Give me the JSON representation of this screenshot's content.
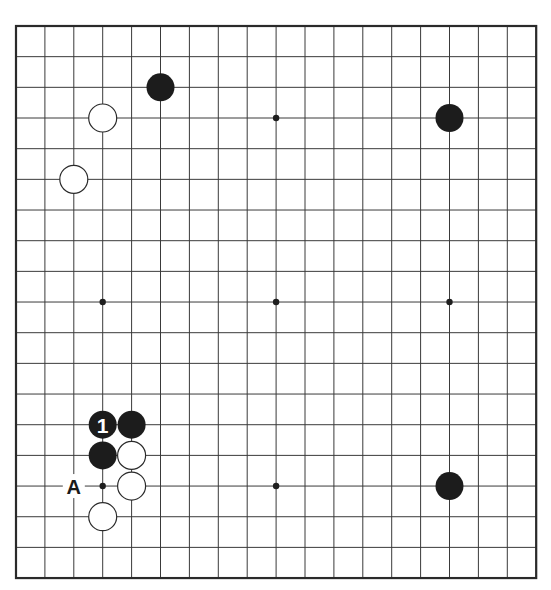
{
  "board": {
    "size": 19,
    "origin_x": 16,
    "origin_y": 26,
    "spacing_x": 28.9,
    "spacing_y": 30.67,
    "stone_radius": 14,
    "colors": {
      "line": "#3a3a3a",
      "black_stone": "#1c1c1c",
      "white_stone": "#ffffff",
      "background": "#ffffff"
    }
  },
  "hoshi": [
    {
      "col": 3,
      "row": 3
    },
    {
      "col": 9,
      "row": 3
    },
    {
      "col": 15,
      "row": 3
    },
    {
      "col": 3,
      "row": 9
    },
    {
      "col": 9,
      "row": 9
    },
    {
      "col": 15,
      "row": 9
    },
    {
      "col": 3,
      "row": 15
    },
    {
      "col": 9,
      "row": 15
    },
    {
      "col": 15,
      "row": 15
    }
  ],
  "stones": [
    {
      "color": "black",
      "col": 5,
      "row": 2
    },
    {
      "color": "white",
      "col": 3,
      "row": 3
    },
    {
      "color": "black",
      "col": 15,
      "row": 3
    },
    {
      "color": "white",
      "col": 2,
      "row": 5
    },
    {
      "color": "black",
      "col": 3,
      "row": 13,
      "label": "1"
    },
    {
      "color": "black",
      "col": 4,
      "row": 13
    },
    {
      "color": "black",
      "col": 3,
      "row": 14
    },
    {
      "color": "white",
      "col": 4,
      "row": 14
    },
    {
      "color": "white",
      "col": 4,
      "row": 15
    },
    {
      "color": "white",
      "col": 3,
      "row": 16
    },
    {
      "color": "black",
      "col": 15,
      "row": 15
    }
  ],
  "markers": [
    {
      "text": "A",
      "col": 2,
      "row": 15
    }
  ]
}
